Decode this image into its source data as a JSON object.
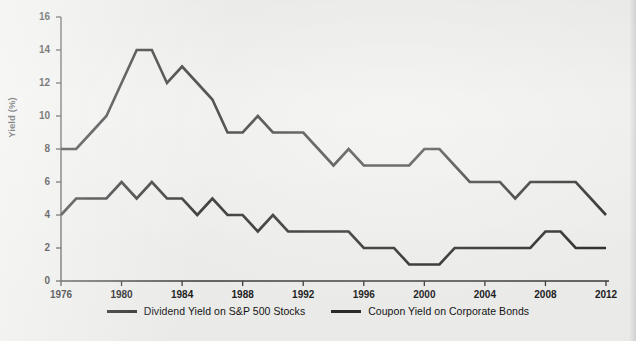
{
  "chart_data": {
    "type": "line",
    "title": "",
    "xlabel": "",
    "ylabel": "Yield (%)",
    "xlim": [
      1976,
      2012
    ],
    "ylim": [
      0,
      16
    ],
    "grid": false,
    "legend_position": "bottom-center",
    "x": [
      1976,
      1977,
      1978,
      1979,
      1980,
      1981,
      1982,
      1983,
      1984,
      1985,
      1986,
      1987,
      1988,
      1989,
      1990,
      1991,
      1992,
      1993,
      1994,
      1995,
      1996,
      1997,
      1998,
      1999,
      2000,
      2001,
      2002,
      2003,
      2004,
      2005,
      2006,
      2007,
      2008,
      2009,
      2010,
      2011,
      2012
    ],
    "xticks": [
      1976,
      1980,
      1984,
      1988,
      1992,
      1996,
      2000,
      2004,
      2008,
      2012
    ],
    "xtick_labels": [
      "1976",
      "1980",
      "1984",
      "1988",
      "1992",
      "1996",
      "2000",
      "2004",
      "2008",
      "2012"
    ],
    "yticks": [
      0,
      2,
      4,
      6,
      8,
      10,
      12,
      14,
      16
    ],
    "ytick_labels": [
      "0",
      "2",
      "4",
      "6",
      "8",
      "10",
      "12",
      "14",
      "16"
    ],
    "series": [
      {
        "name": "Coupon Yield on Corporate Bonds",
        "color": "#2b2b2b",
        "values": [
          8,
          8,
          9,
          10,
          12,
          14,
          14,
          12,
          13,
          12,
          11,
          9,
          9,
          10,
          9,
          9,
          9,
          8,
          7,
          8,
          7,
          7,
          7,
          7,
          8,
          8,
          7,
          6,
          6,
          6,
          5,
          6,
          6,
          6,
          6,
          5,
          4
        ]
      },
      {
        "name": "Dividend Yield on S&P 500 Stocks",
        "color": "#2b2b2b",
        "values": [
          4,
          5,
          5,
          5,
          6,
          5,
          6,
          5,
          5,
          4,
          5,
          4,
          4,
          3,
          4,
          3,
          3,
          3,
          3,
          3,
          2,
          2,
          2,
          1,
          1,
          1,
          2,
          2,
          2,
          2,
          2,
          2,
          3,
          3,
          2,
          2,
          2
        ]
      }
    ]
  },
  "axes": {
    "y_axis_title": "Yield (%)"
  },
  "legend": {
    "items": [
      {
        "label": "Dividend Yield on S&P 500 Stocks",
        "color": "#2b2b2b"
      },
      {
        "label": "Coupon Yield on Corporate Bonds",
        "color": "#2b2b2b"
      }
    ]
  }
}
